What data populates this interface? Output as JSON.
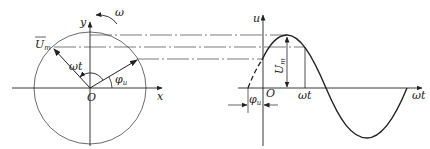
{
  "phasor": {
    "x_axis_label": "x",
    "y_axis_label": "y",
    "origin_label": "O",
    "rotation_label": "ω",
    "vector_label_main": "U",
    "vector_label_sub": "m",
    "angle_wt_label": "ωt",
    "angle_phi_label_main": "φ",
    "angle_phi_label_sub": "u"
  },
  "waveform": {
    "u_axis_label": "u",
    "wt_axis_label": "ωt",
    "origin_label": "O",
    "amplitude_label_main": "U",
    "amplitude_label_sub": "m",
    "wt_marker_label": "ωt",
    "phase_label_main": "φ",
    "phase_label_sub": "u"
  },
  "colors": {
    "stroke": "#222222",
    "thin": "#444444",
    "background": "#ffffff"
  }
}
